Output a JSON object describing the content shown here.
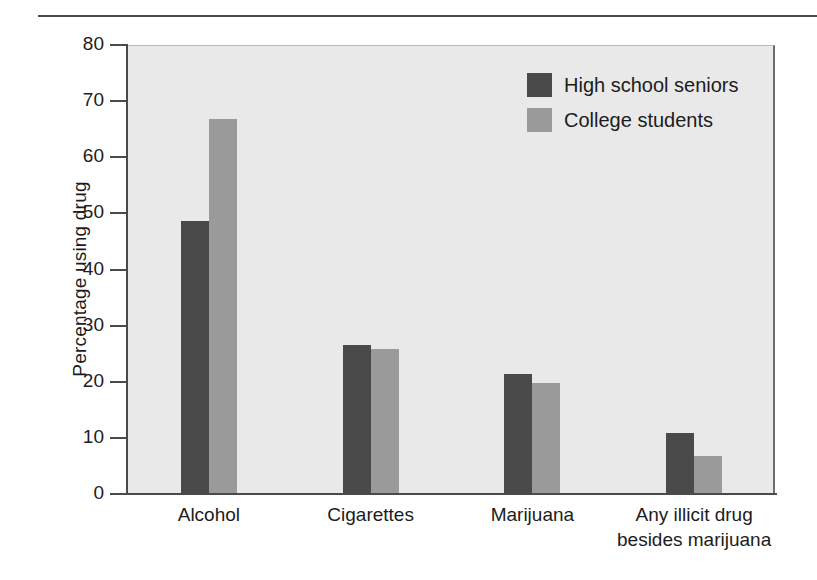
{
  "chart_data": {
    "type": "bar",
    "title": "",
    "xlabel": "",
    "ylabel": "Percentage using drug",
    "ylim": [
      0,
      80
    ],
    "yticks": [
      0,
      10,
      20,
      30,
      40,
      50,
      60,
      70,
      80
    ],
    "ytick_labels": [
      "0",
      "10",
      "20",
      "30",
      "40",
      "50",
      "60",
      "70",
      "80"
    ],
    "grid": false,
    "legend_position": "top-right",
    "categories": [
      "Alcohol",
      "Cigarettes",
      "Marijuana",
      "Any illicit drug besides marijuana"
    ],
    "category_lines": [
      [
        "Alcohol"
      ],
      [
        "Cigarettes"
      ],
      [
        "Marijuana"
      ],
      [
        "Any illicit drug",
        "besides marijuana"
      ]
    ],
    "series": [
      {
        "name": "High school seniors",
        "color": "#4a4a4a",
        "values": [
          48.6,
          26.6,
          21.3,
          10.9
        ]
      },
      {
        "name": "College students",
        "color": "#9a9a9a",
        "values": [
          66.9,
          25.9,
          19.7,
          6.8
        ]
      }
    ]
  },
  "legend": {
    "items": [
      {
        "label": "High school seniors",
        "color": "#4a4a4a"
      },
      {
        "label": "College students",
        "color": "#9a9a9a"
      }
    ]
  },
  "colors": {
    "series_dark": "#4a4a4a",
    "series_light": "#9a9a9a",
    "plot_background": "#e9e9e9",
    "axis": "#4a4a4a",
    "text": "#1c1c1c",
    "rule": "#4a4a4a"
  }
}
